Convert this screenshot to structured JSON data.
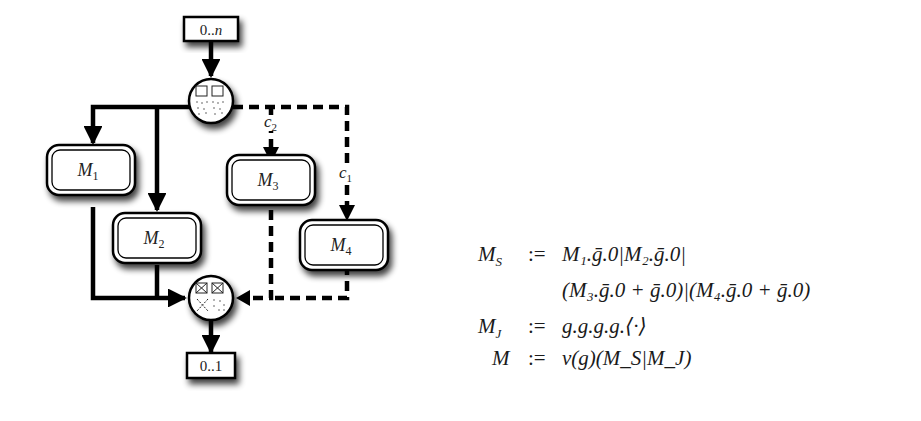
{
  "diagram": {
    "input_multiplicity": "0..n",
    "output_multiplicity": "0..1",
    "modules": [
      {
        "name": "M",
        "sub": "1"
      },
      {
        "name": "M",
        "sub": "2"
      },
      {
        "name": "M",
        "sub": "3"
      },
      {
        "name": "M",
        "sub": "4"
      }
    ],
    "conditions": [
      {
        "name": "c",
        "sub": "2"
      },
      {
        "name": "c",
        "sub": "1"
      }
    ],
    "split_gateway": "split-node",
    "join_gateway": "join-node",
    "colors": {
      "line": "#000000",
      "box_fill": "#ffffff",
      "shadow": "#444444"
    }
  },
  "formulas": [
    {
      "lhs": "M_S",
      "lhs_main": "M",
      "lhs_sub": "S",
      "assign": ":=",
      "rhs": "M₁.ḡ.0|M₂.ḡ.0|"
    },
    {
      "lhs": "",
      "lhs_main": "",
      "lhs_sub": "",
      "assign": "",
      "rhs": "(M₃.ḡ.0 + ḡ.0)|(M₄.ḡ.0 + ḡ.0)"
    },
    {
      "lhs": "M_J",
      "lhs_main": "M",
      "lhs_sub": "J",
      "assign": ":=",
      "rhs": "g.g.g.g.⟨·⟩"
    },
    {
      "lhs": "M",
      "lhs_main": "M",
      "lhs_sub": "",
      "assign": ":=",
      "rhs": "ν(g)(M_S|M_J)"
    }
  ]
}
